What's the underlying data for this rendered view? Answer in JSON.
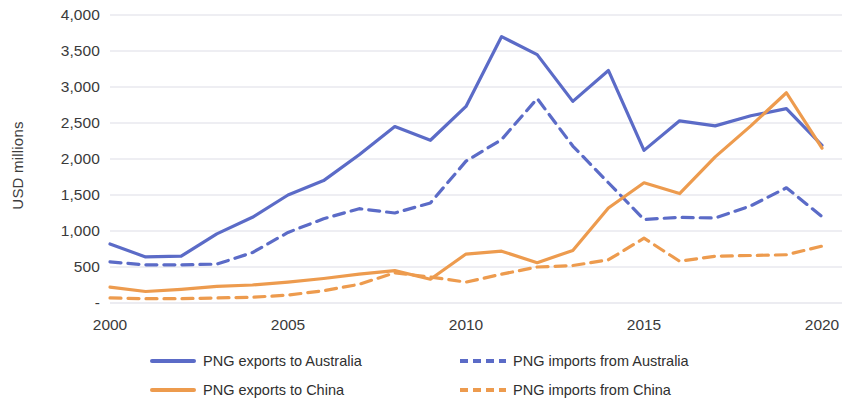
{
  "chart_data": {
    "type": "line",
    "title": "",
    "xlabel": "",
    "ylabel": "USD millions",
    "xlim": [
      2000,
      2020
    ],
    "ylim": [
      0,
      4000
    ],
    "grid": true,
    "legend_position": "bottom",
    "x": [
      2000,
      2001,
      2002,
      2003,
      2004,
      2005,
      2006,
      2007,
      2008,
      2009,
      2010,
      2011,
      2012,
      2013,
      2014,
      2015,
      2016,
      2017,
      2018,
      2019,
      2020
    ],
    "xticks": [
      "2000",
      "2005",
      "2010",
      "2015",
      "2020"
    ],
    "xtick_values": [
      2000,
      2005,
      2010,
      2015,
      2020
    ],
    "yticks": [
      "-",
      "500",
      "1,000",
      "1,500",
      "2,000",
      "2,500",
      "3,000",
      "3,500",
      "4,000"
    ],
    "ytick_values": [
      0,
      500,
      1000,
      1500,
      2000,
      2500,
      3000,
      3500,
      4000
    ],
    "series": [
      {
        "name": "PNG exports to Australia",
        "style": "solid",
        "color": "#5B6BC7",
        "values": [
          820,
          640,
          650,
          960,
          1190,
          1500,
          1700,
          2060,
          2450,
          2260,
          2730,
          3700,
          3450,
          2800,
          3230,
          2120,
          2530,
          2460,
          2600,
          2700,
          2190
        ]
      },
      {
        "name": "PNG imports from Australia",
        "style": "dashed",
        "color": "#5B6BC7",
        "values": [
          570,
          530,
          530,
          540,
          700,
          980,
          1170,
          1310,
          1250,
          1390,
          1970,
          2270,
          2840,
          2180,
          1670,
          1160,
          1190,
          1180,
          1350,
          1600,
          1200
        ]
      },
      {
        "name": "PNG exports to China",
        "style": "solid",
        "color": "#ED9B4E",
        "values": [
          220,
          160,
          190,
          230,
          250,
          290,
          340,
          400,
          450,
          330,
          680,
          720,
          560,
          730,
          1320,
          1670,
          1520,
          2030,
          2460,
          2920,
          2150
        ]
      },
      {
        "name": "PNG imports from China",
        "style": "dashed",
        "color": "#ED9B4E",
        "values": [
          70,
          60,
          60,
          70,
          80,
          110,
          170,
          260,
          420,
          360,
          290,
          400,
          500,
          520,
          600,
          900,
          580,
          650,
          660,
          670,
          790
        ]
      }
    ]
  },
  "axis": {
    "y_title": "USD millions"
  },
  "legend": {
    "items": [
      {
        "label": "PNG exports to Australia",
        "style": "solid",
        "color": "#5B6BC7"
      },
      {
        "label": "PNG imports from Australia",
        "style": "dashed",
        "color": "#5B6BC7"
      },
      {
        "label": "PNG exports to China",
        "style": "solid",
        "color": "#ED9B4E"
      },
      {
        "label": "PNG imports from China",
        "style": "dashed",
        "color": "#ED9B4E"
      }
    ],
    "order": [
      0,
      1,
      2,
      3
    ]
  }
}
